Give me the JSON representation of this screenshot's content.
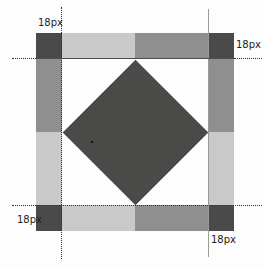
{
  "figure": {
    "type": "border-image-slice-diagram",
    "slice_size_px": 18,
    "labels": {
      "top_left": "18px",
      "top_right": "18px",
      "bottom_left": "18px",
      "bottom_right": "18px"
    },
    "colors": {
      "corner_dark": "#4a4a4a",
      "edge_light_gray": "#c9c9c9",
      "edge_medium_gray": "#8f8f8f",
      "diamond_dark": "#4a4a48",
      "background": "#fdfdfd",
      "dotted_guide_line": "#333333",
      "solid_guide_line_right": "#9a9a9a",
      "solid_guide_line_top": "#4d4d4d",
      "label_text": "#222222"
    }
  }
}
